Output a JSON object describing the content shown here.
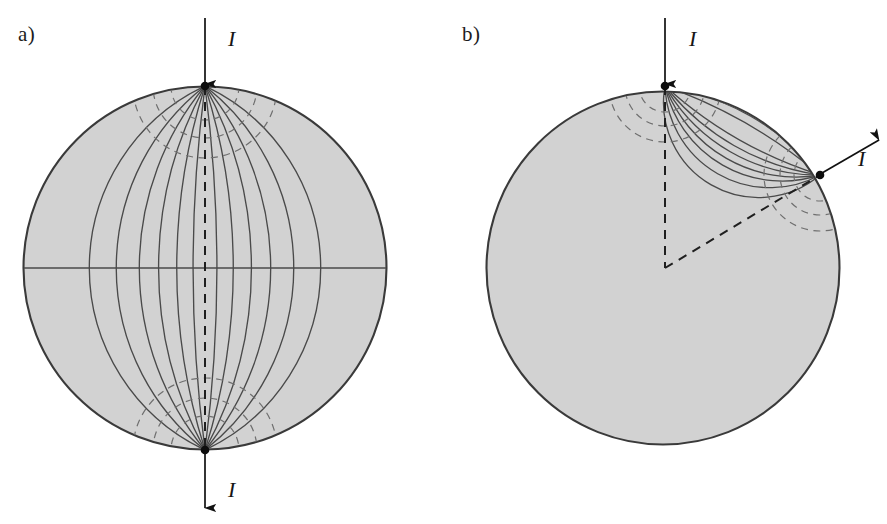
{
  "figure": {
    "width": 887,
    "height": 524,
    "background": "#ffffff",
    "disk_fill": "#d2d2d2",
    "disk_stroke": "#3a3a3a",
    "streamline_color": "#4a4a4a",
    "equipotential_color": "#6a6a6a",
    "arrow_color": "#111111",
    "contact_dot_color": "#0d0d0d"
  },
  "panels": [
    {
      "id": "a",
      "label": "a)",
      "description": "Current injected at the top pole and extracted at the bottom pole of a circular conducting disk; streamlines are circular arcs joining the two antipodal contacts.",
      "circle": {
        "cx": 205,
        "cy": 268,
        "r": 182
      },
      "contacts": [
        {
          "name": "current-inlet",
          "x": 205,
          "y": 86,
          "label": "I",
          "label_x": 228,
          "label_y": 46,
          "arrow_from_x": 205,
          "arrow_from_y": 18,
          "arrow_to_x": 205,
          "arrow_to_y": 84
        },
        {
          "name": "current-outlet",
          "x": 205,
          "y": 450,
          "label": "I",
          "label_x": 228,
          "label_y": 497,
          "arrow_from_x": 205,
          "arrow_from_y": 452,
          "arrow_to_x": 205,
          "arrow_to_y": 508
        }
      ],
      "symmetry_axis": {
        "x1": 205,
        "y1": 86,
        "x2": 205,
        "y2": 450,
        "style": "dashed"
      },
      "streamline_offsets": [
        -150,
        -110,
        -78,
        -52,
        -30,
        -12,
        12,
        30,
        52,
        78,
        110,
        150
      ],
      "equipotential_radii": [
        34,
        52,
        72
      ],
      "straight_streamline_y": 268
    },
    {
      "id": "b",
      "label": "b)",
      "description": "Current injected at the top pole and extracted at a contact on the upper-right rim; streamlines crowd strongly near the closely spaced contacts.",
      "circle": {
        "cx": 663,
        "cy": 268,
        "r": 177
      },
      "contacts": [
        {
          "name": "current-inlet",
          "x": 665,
          "y": 86,
          "label": "I",
          "label_x": 689,
          "label_y": 46,
          "arrow_from_x": 665,
          "arrow_from_y": 18,
          "arrow_to_x": 665,
          "arrow_to_y": 84
        },
        {
          "name": "current-outlet",
          "x": 820,
          "y": 175,
          "label": "I",
          "label_x": 858,
          "label_y": 166,
          "arrow_from_x": 822,
          "arrow_from_y": 173,
          "arrow_to_x": 879,
          "arrow_to_y": 140
        }
      ],
      "symmetry_axis": {
        "x1": 665,
        "y1": 86,
        "x2": 665,
        "y2": 268,
        "style": "dashed"
      },
      "exit_radius_line": {
        "x1": 665,
        "y1": 268,
        "x2": 820,
        "y2": 175,
        "style": "dashed"
      },
      "stagnation_point": {
        "x": 665,
        "y": 268
      },
      "streamline_offsets": [
        -165,
        -120,
        -86,
        -58,
        -36,
        -18,
        -6,
        8,
        20,
        34,
        50,
        70,
        96,
        130,
        175
      ],
      "equipotential_radii": [
        26,
        40,
        56
      ]
    }
  ]
}
